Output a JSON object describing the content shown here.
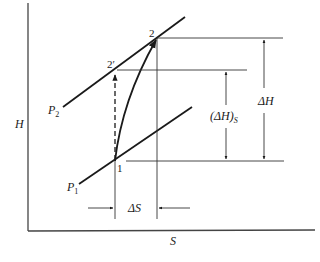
{
  "diagram": {
    "type": "Mollier H-S diagram of compression process",
    "axes": {
      "y_label": "H",
      "x_label": "S"
    },
    "isobars": [
      {
        "name": "P2",
        "label_main": "P",
        "label_sub": "2"
      },
      {
        "name": "P1",
        "label_main": "P",
        "label_sub": "1"
      }
    ],
    "points": {
      "p1": "1",
      "p2": "2",
      "p2s": "2′"
    },
    "dimensions": {
      "delta_h": "ΔH",
      "delta_h_s_main": "(ΔH)",
      "delta_h_s_sub": "S",
      "delta_s": "ΔS"
    },
    "colors": {
      "line": "#1a1a1a",
      "thin": "#333333",
      "axis": "#444444"
    }
  }
}
